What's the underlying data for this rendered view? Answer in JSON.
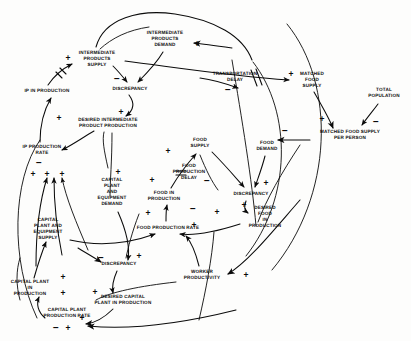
{
  "diagram": {
    "type": "causal-loop-diagram",
    "width": 411,
    "height": 341,
    "background_color": "#fdfdfc",
    "ink_color": "#0b0b0b"
  },
  "nodes": [
    {
      "id": "intermediate-products-demand",
      "label": "INTERMEDIATE\nPRODUCTS\nDEMAND",
      "x": 165,
      "y": 39
    },
    {
      "id": "intermediate-products-supply",
      "label": "INTERMEDIATE\nPRODUCTS\nSUPPLY",
      "x": 97,
      "y": 59
    },
    {
      "id": "discrepancy-ip",
      "label": "DISCREPANCY",
      "x": 130,
      "y": 89
    },
    {
      "id": "ip-in-production",
      "label": "IP IN PRODUCTION",
      "x": 47,
      "y": 91
    },
    {
      "id": "desired-intermediate-product-production",
      "label": "DESIRED INTERMEDIATE\nPRODUCT PRODUCTION",
      "x": 108,
      "y": 123
    },
    {
      "id": "ip-production-rate",
      "label": "IP PRODUCTION\nRATE",
      "x": 42,
      "y": 150
    },
    {
      "id": "transportation-delay",
      "label": "TRANSPORTATION\nDELAY",
      "x": 235,
      "y": 77
    },
    {
      "id": "matched-food-supply",
      "label": "MATCHED\nFOOD\nSUPPLY",
      "x": 312,
      "y": 80
    },
    {
      "id": "total-population",
      "label": "TOTAL\nPOPULATION",
      "x": 384,
      "y": 93
    },
    {
      "id": "matched-food-supply-per-person",
      "label": "MATCHED FOOD SUPPLY\nPER PERSON",
      "x": 350,
      "y": 135
    },
    {
      "id": "food-supply",
      "label": "FOOD\nSUPPLY",
      "x": 200,
      "y": 143
    },
    {
      "id": "food-demand",
      "label": "FOOD\nDEMAND",
      "x": 267,
      "y": 146
    },
    {
      "id": "food-production-delay",
      "label": "FOOD\nPRODUCTION\nDELAY",
      "x": 189,
      "y": 172
    },
    {
      "id": "discrepancy-food",
      "label": "DISCREPANCY",
      "x": 251,
      "y": 194
    },
    {
      "id": "capital-plant-and-equipment-demand",
      "label": "CAPITAL\nPLANT\nAND\nEQUIPMENT\nDEMAND",
      "x": 112,
      "y": 192
    },
    {
      "id": "food-in-production",
      "label": "FOOD IN\nPRODUCTION",
      "x": 164,
      "y": 196
    },
    {
      "id": "desired-food-in-production",
      "label": "DESIRED\nFOOD\nIN\nPRODUCTION",
      "x": 265,
      "y": 217
    },
    {
      "id": "food-production-rate",
      "label": "FOOD PRODUCTION RATE",
      "x": 168,
      "y": 228
    },
    {
      "id": "capital-plant-and-equipment-supply",
      "label": "CAPITAL\nPLANT AND\nEQUIPMENT\nSUPPLY",
      "x": 48,
      "y": 229
    },
    {
      "id": "discrepancy-capital",
      "label": "DISCREPANCY",
      "x": 119,
      "y": 264
    },
    {
      "id": "worker-productivity",
      "label": "WORKER\nPRODUCTIVITY",
      "x": 202,
      "y": 275
    },
    {
      "id": "capital-plant-in-production",
      "label": "CAPITAL PLANT\nIN\nPRODUCTION",
      "x": 30,
      "y": 288
    },
    {
      "id": "desired-capital-plant-in-production",
      "label": "DESIRED CAPITAL\nPLANT IN PRODUCTION",
      "x": 123,
      "y": 300
    },
    {
      "id": "capital-plant-production-rate",
      "label": "CAPITAL PLANT\nPRODUCTION RATE",
      "x": 67,
      "y": 313
    }
  ],
  "polarities": [
    {
      "id": "p-ip-supply-plus",
      "sign": "+",
      "x": 68,
      "y": 58
    },
    {
      "id": "p-ipd-plus",
      "sign": "+",
      "x": 197,
      "y": 44
    },
    {
      "id": "p-ip-supply-to-disc",
      "sign": "−",
      "x": 117,
      "y": 79
    },
    {
      "id": "p-ip-in-prod-plus",
      "sign": "+",
      "x": 59,
      "y": 118
    },
    {
      "id": "p-desired-ip-plus",
      "sign": "+",
      "x": 121,
      "y": 112
    },
    {
      "id": "p-ip-rate-minus",
      "sign": "−",
      "x": 39,
      "y": 163
    },
    {
      "id": "p-ip-rate-plus-a",
      "sign": "+",
      "x": 33,
      "y": 174
    },
    {
      "id": "p-ip-rate-plus-b",
      "sign": "+",
      "x": 47,
      "y": 174
    },
    {
      "id": "p-ip-rate-plus-c",
      "sign": "+",
      "x": 62,
      "y": 174
    },
    {
      "id": "p-transport-minus",
      "sign": "−",
      "x": 228,
      "y": 90
    },
    {
      "id": "p-matched-supply-plus",
      "sign": "+",
      "x": 291,
      "y": 74
    },
    {
      "id": "p-mfspp-plus",
      "sign": "+",
      "x": 322,
      "y": 119
    },
    {
      "id": "p-total-pop-minus",
      "sign": "−",
      "x": 376,
      "y": 122
    },
    {
      "id": "p-food-demand-minus",
      "sign": "−",
      "x": 285,
      "y": 131
    },
    {
      "id": "p-food-supply-plus",
      "sign": "+",
      "x": 168,
      "y": 151
    },
    {
      "id": "p-food-prod-delay-minus",
      "sign": "−",
      "x": 207,
      "y": 181
    },
    {
      "id": "p-food-disc-plus",
      "sign": "+",
      "x": 266,
      "y": 183
    },
    {
      "id": "p-cape-demand-plus",
      "sign": "+",
      "x": 118,
      "y": 172
    },
    {
      "id": "p-food-in-prod-plus",
      "sign": "+",
      "x": 152,
      "y": 180
    },
    {
      "id": "p-food-rate-plus-up",
      "sign": "+",
      "x": 148,
      "y": 213
    },
    {
      "id": "p-food-rate-minus",
      "sign": "−",
      "x": 193,
      "y": 209
    },
    {
      "id": "p-food-rate-plus-r",
      "sign": "+",
      "x": 217,
      "y": 212
    },
    {
      "id": "p-food-rate-plus-b",
      "sign": "+",
      "x": 194,
      "y": 225
    },
    {
      "id": "p-desired-food-plus",
      "sign": "+",
      "x": 244,
      "y": 205
    },
    {
      "id": "p-cap-disc-minus",
      "sign": "−",
      "x": 101,
      "y": 258
    },
    {
      "id": "p-cap-disc-plus",
      "sign": "+",
      "x": 139,
      "y": 256
    },
    {
      "id": "p-desired-cap-plus",
      "sign": "+",
      "x": 95,
      "y": 292
    },
    {
      "id": "p-cap-in-prod-plus",
      "sign": "+",
      "x": 63,
      "y": 277
    },
    {
      "id": "p-cap-in-prod-plus2",
      "sign": "+",
      "x": 63,
      "y": 293
    },
    {
      "id": "p-cap-rate-minus",
      "sign": "−",
      "x": 56,
      "y": 328
    },
    {
      "id": "p-cap-rate-plus",
      "sign": "+",
      "x": 68,
      "y": 328
    },
    {
      "id": "p-cap-rate-plus2",
      "sign": "+",
      "x": 82,
      "y": 318
    },
    {
      "id": "p-worker-prod-plus",
      "sign": "+",
      "x": 246,
      "y": 275
    },
    {
      "id": "p-cape-supply-plus-a",
      "sign": "+",
      "x": 46,
      "y": 174
    }
  ],
  "links": [
    {
      "id": "link-ipd-to-ip-discrepancy",
      "from": "intermediate-products-demand",
      "to": "discrepancy-ip",
      "sign": "+"
    },
    {
      "id": "link-ip-supply-to-ip-discrepancy",
      "from": "intermediate-products-supply",
      "to": "discrepancy-ip",
      "sign": "−"
    },
    {
      "id": "link-ip-discrepancy-to-desired-ip",
      "from": "discrepancy-ip",
      "to": "desired-intermediate-product-production",
      "sign": "+"
    },
    {
      "id": "link-desired-ip-to-ip-rate",
      "from": "desired-intermediate-product-production",
      "to": "ip-production-rate",
      "sign": "+"
    },
    {
      "id": "link-ip-rate-to-ip-in-production",
      "from": "ip-production-rate",
      "to": "ip-in-production",
      "sign": "+"
    },
    {
      "id": "link-ip-in-production-to-ip-supply",
      "from": "ip-in-production",
      "to": "intermediate-products-supply",
      "sign": "+",
      "delay": true
    },
    {
      "id": "link-ip-supply-to-matched-food-supply",
      "from": "intermediate-products-supply",
      "to": "matched-food-supply",
      "sign": "+",
      "delay": true
    },
    {
      "id": "link-transport-delay-to-matched-food-supply",
      "from": "transportation-delay",
      "to": "matched-food-supply",
      "sign": "−"
    },
    {
      "id": "link-matched-food-supply-to-per-person",
      "from": "matched-food-supply",
      "to": "matched-food-supply-per-person",
      "sign": "+"
    },
    {
      "id": "link-total-population-to-per-person",
      "from": "total-population",
      "to": "matched-food-supply-per-person",
      "sign": "−"
    },
    {
      "id": "link-per-person-to-food-demand",
      "from": "matched-food-supply-per-person",
      "to": "food-demand",
      "sign": "−"
    },
    {
      "id": "link-food-demand-to-food-discrepancy",
      "from": "food-demand",
      "to": "discrepancy-food",
      "sign": "+"
    },
    {
      "id": "link-food-supply-to-food-discrepancy",
      "from": "food-supply",
      "to": "discrepancy-food",
      "sign": "−"
    },
    {
      "id": "link-food-discrepancy-to-desired-food",
      "from": "discrepancy-food",
      "to": "desired-food-in-production",
      "sign": "+"
    },
    {
      "id": "link-desired-food-to-food-rate",
      "from": "desired-food-in-production",
      "to": "food-production-rate",
      "sign": "+"
    },
    {
      "id": "link-food-rate-to-food-in-production",
      "from": "food-production-rate",
      "to": "food-in-production",
      "sign": "+"
    },
    {
      "id": "link-food-in-production-to-food-supply",
      "from": "food-in-production",
      "to": "food-supply",
      "sign": "+",
      "delay": true
    },
    {
      "id": "link-worker-productivity-to-food-rate",
      "from": "worker-productivity",
      "to": "food-production-rate",
      "sign": "+"
    },
    {
      "id": "link-cape-supply-to-food-rate",
      "from": "capital-plant-and-equipment-supply",
      "to": "food-production-rate",
      "sign": "+"
    },
    {
      "id": "link-cape-demand-to-cap-discrepancy",
      "from": "capital-plant-and-equipment-demand",
      "to": "discrepancy-capital",
      "sign": "+"
    },
    {
      "id": "link-cape-supply-to-cap-discrepancy",
      "from": "capital-plant-and-equipment-supply",
      "to": "discrepancy-capital",
      "sign": "−"
    },
    {
      "id": "link-cap-discrepancy-to-desired-cap",
      "from": "discrepancy-capital",
      "to": "desired-capital-plant-in-production",
      "sign": "+"
    },
    {
      "id": "link-desired-cap-to-cap-rate",
      "from": "desired-capital-plant-in-production",
      "to": "capital-plant-production-rate",
      "sign": "+"
    },
    {
      "id": "link-cap-rate-to-cap-in-production",
      "from": "capital-plant-production-rate",
      "to": "capital-plant-in-production",
      "sign": "+"
    },
    {
      "id": "link-cap-in-production-to-cape-supply",
      "from": "capital-plant-in-production",
      "to": "capital-plant-and-equipment-supply",
      "sign": "+"
    }
  ]
}
